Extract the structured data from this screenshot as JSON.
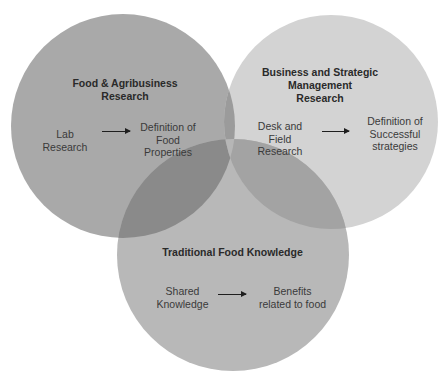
{
  "colors": {
    "background": "#ffffff",
    "food_agribusiness_circle": "#a9a9a9",
    "business_strategic_circle": "#d3d3d3",
    "traditional_food_circle": "#b8b8b8",
    "overlap_food_business": "#9b9b9b",
    "overlap_food_traditional": "#8a8a8a",
    "overlap_business_traditional": "#a3a3a3",
    "overlap_all": "#b6b6b6"
  },
  "circles": {
    "food_agribusiness": {
      "title": "Food & Agribusiness Research",
      "title_lines": [
        "Food & Agribusiness",
        "Research"
      ],
      "input_lines": [
        "Lab",
        "Research"
      ],
      "output_lines": [
        "Definition of",
        "Food",
        "Properties"
      ],
      "arrow": "arrow-right-icon"
    },
    "business_strategic": {
      "title": "Business and Strategic Management Research",
      "title_lines": [
        "Business and Strategic",
        "Management",
        "Research"
      ],
      "input_lines": [
        "Desk and",
        "Field",
        "Research"
      ],
      "output_lines": [
        "Definition of",
        "Successful",
        "strategies"
      ],
      "arrow": "arrow-right-icon"
    },
    "traditional_food": {
      "title": "Traditional Food Knowledge",
      "title_lines": [
        "Traditional Food Knowledge"
      ],
      "input_lines": [
        "Shared",
        "Knowledge"
      ],
      "output_lines": [
        "Benefits",
        "related to food"
      ],
      "arrow": "arrow-right-icon"
    }
  }
}
